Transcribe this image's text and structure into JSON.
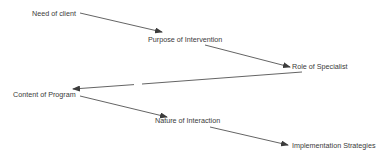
{
  "diagram": {
    "type": "flow",
    "nodes": [
      {
        "id": "need",
        "label": "Need of client",
        "x": 32,
        "y": 10
      },
      {
        "id": "purpose",
        "label": "Purpose of Intervention",
        "x": 148,
        "y": 36
      },
      {
        "id": "role",
        "label": "Role of Specialist",
        "x": 292,
        "y": 63
      },
      {
        "id": "content",
        "label": "Content of Program",
        "x": 13,
        "y": 91
      },
      {
        "id": "nature",
        "label": "Nature of Interaction",
        "x": 155,
        "y": 117
      },
      {
        "id": "implementation",
        "label": "Implementation Strategies",
        "x": 292,
        "y": 142
      }
    ],
    "edges": [
      {
        "from": "need",
        "to": "purpose"
      },
      {
        "from": "purpose",
        "to": "role"
      },
      {
        "from": "role",
        "to": "content"
      },
      {
        "from": "content",
        "to": "nature"
      },
      {
        "from": "nature",
        "to": "implementation"
      }
    ],
    "colors": {
      "line": "#3c3c3c",
      "text": "#3a3a3a",
      "background": "#ffffff"
    }
  }
}
